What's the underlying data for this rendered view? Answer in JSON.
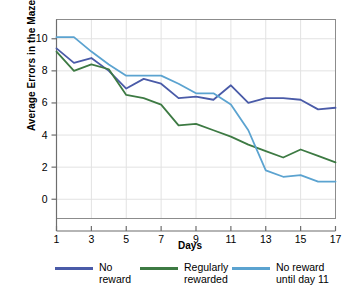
{
  "chart_data": {
    "type": "line",
    "title": "",
    "xlabel": "Days",
    "ylabel": "Average Errors in the Maze",
    "x": [
      1,
      2,
      3,
      4,
      5,
      6,
      7,
      8,
      9,
      10,
      11,
      12,
      13,
      14,
      15,
      16,
      17
    ],
    "xlim": [
      1,
      17
    ],
    "ylim": [
      -1.2,
      11.2
    ],
    "xticks": [
      1,
      3,
      5,
      7,
      9,
      11,
      13,
      15,
      17
    ],
    "yticks": [
      0,
      2,
      4,
      6,
      8,
      10
    ],
    "grid": true,
    "legend_position": "bottom",
    "series": [
      {
        "name": "No reward",
        "color": "#4a5ba8",
        "values": [
          9.4,
          8.5,
          8.8,
          8.0,
          6.9,
          7.5,
          7.2,
          6.3,
          6.4,
          6.2,
          7.1,
          6.0,
          6.3,
          6.3,
          6.2,
          5.6,
          5.7
        ]
      },
      {
        "name": "Regularly rewarded",
        "color": "#3d7a43",
        "values": [
          9.2,
          8.0,
          8.4,
          8.1,
          6.5,
          6.3,
          5.9,
          4.6,
          4.7,
          4.3,
          3.9,
          3.4,
          3.0,
          2.6,
          3.1,
          2.7,
          2.3
        ]
      },
      {
        "name": "No reward until day 11",
        "color": "#5ba3d0",
        "values": [
          10.1,
          10.1,
          9.2,
          8.4,
          7.7,
          7.7,
          7.7,
          7.2,
          6.6,
          6.6,
          5.9,
          4.3,
          1.8,
          1.4,
          1.5,
          1.1,
          1.1
        ]
      }
    ]
  },
  "axes": {
    "ylabel": "Average Errors in the Maze",
    "xlabel": "Days",
    "ytick_labels": [
      "10",
      "8",
      "6",
      "4",
      "2",
      "0"
    ],
    "xtick_labels": [
      "1",
      "3",
      "5",
      "7",
      "9",
      "11",
      "13",
      "15",
      "17"
    ]
  },
  "legend": {
    "items": [
      {
        "label": "No\nreward",
        "color": "#4a5ba8"
      },
      {
        "label": "Regularly\nrewarded",
        "color": "#3d7a43"
      },
      {
        "label": "No reward\nuntil day 11",
        "color": "#5ba3d0"
      }
    ]
  },
  "colors": {
    "series_no_reward": "#4a5ba8",
    "series_regularly_rewarded": "#3d7a43",
    "series_no_reward_until_day_11": "#5ba3d0",
    "axis": "#6d6d6d",
    "grid": "#e2e2e2",
    "background": "#ffffff"
  }
}
